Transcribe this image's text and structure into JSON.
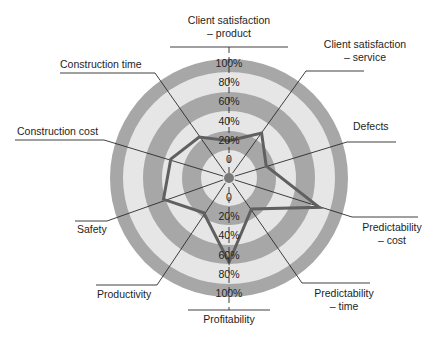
{
  "chart_data": {
    "type": "radar",
    "title": "",
    "scale": {
      "min": 0,
      "max": 100,
      "unit": "%",
      "ticks": [
        "0",
        "20%",
        "40%",
        "60%",
        "80%",
        "100%"
      ]
    },
    "axes": [
      "Client satisfaction – product",
      "Client satisfaction – service",
      "Defects",
      "Predictability – cost",
      "Predictability – time",
      "Profitability",
      "Productivity",
      "Safety",
      "Construction cost",
      "Construction time"
    ],
    "series": [
      {
        "name": "Performance",
        "values": [
          19,
          38,
          21,
          79,
          20,
          68,
          25,
          52,
          44,
          33
        ]
      }
    ],
    "legend": null,
    "grid": "concentric bands"
  },
  "colors": {
    "band_dark": "#a7a7a7",
    "band_light": "#e6e6e6",
    "polygon": "#606060",
    "spoke": "#2a2a2a",
    "center_dot": "#7a7a7a"
  },
  "labels": {
    "client_sat_product_1": "Client satisfaction",
    "client_sat_product_2": "– product",
    "client_sat_service_1": "Client satisfaction",
    "client_sat_service_2": "– service",
    "defects": "Defects",
    "pred_cost_1": "Predictability",
    "pred_cost_2": "– cost",
    "pred_time_1": "Predictability",
    "pred_time_2": "– time",
    "profitability": "Profitability",
    "productivity": "Productivity",
    "safety": "Safety",
    "construction_cost": "Construction cost",
    "construction_time": "Construction time"
  }
}
